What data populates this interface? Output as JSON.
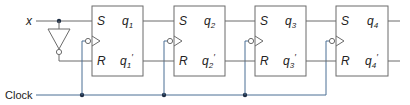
{
  "diagram": {
    "type": "shift-register circuit",
    "input_label": "x",
    "clock_label": "Clock",
    "flip_flops": [
      {
        "s": "S",
        "r": "R",
        "q": "q",
        "q_sub": "1",
        "qn_sub": "1",
        "prime": "′"
      },
      {
        "s": "S",
        "r": "R",
        "q": "q",
        "q_sub": "2",
        "qn_sub": "2",
        "prime": "′"
      },
      {
        "s": "S",
        "r": "R",
        "q": "q",
        "q_sub": "3",
        "qn_sub": "3",
        "prime": "′"
      },
      {
        "s": "S",
        "r": "R",
        "q": "q",
        "q_sub": "4",
        "qn_sub": "4",
        "prime": "′"
      }
    ],
    "colors": {
      "wire": "#6b6b6b",
      "clock_wire": "#4a6e94",
      "junction": "#1f2f45"
    }
  }
}
